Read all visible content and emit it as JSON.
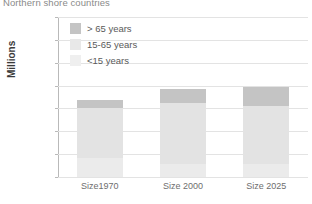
{
  "chart_data": {
    "type": "bar",
    "stacked": true,
    "title": "Northern shore countries",
    "xlabel": "",
    "ylabel": "Millions",
    "ylim": [
      0,
      350
    ],
    "yticks": [
      0,
      50,
      100,
      150,
      200,
      250,
      300,
      350
    ],
    "grid": true,
    "legend_position": "inside top-left",
    "categories": [
      "Size1970",
      "Size 2000",
      "Size 2025"
    ],
    "series": [
      {
        "name": "<15 years",
        "values": [
          42,
          29,
          28
        ],
        "color": "#ebebeb"
      },
      {
        "name": "15-65 years",
        "values": [
          110,
          133,
          127
        ],
        "color": "#e3e3e3"
      },
      {
        "name": "> 65 years",
        "values": [
          16,
          31,
          43
        ],
        "color": "#c4c4c4"
      }
    ],
    "totals": [
      168,
      193,
      198
    ],
    "legend_order": [
      "> 65 years",
      "15-65 years",
      "<15 years"
    ]
  },
  "axis": {
    "y_title": "Millions",
    "y_tick_labels": [
      "350",
      "300",
      "250",
      "200",
      "150",
      "100",
      "50",
      "0"
    ],
    "x_tick_labels": [
      "Size1970",
      "Size 2000",
      "Size 2025"
    ]
  },
  "legend": {
    "items": [
      {
        "label": "> 65 years",
        "color": "#c4c4c4"
      },
      {
        "label": "15-65 years",
        "color": "#e8e8e8"
      },
      {
        "label": "<15 years",
        "color": "#efefef"
      }
    ]
  },
  "colors": {
    "grid": "#e3e3e3",
    "axis": "#9a9a9a",
    "text": "#6e6e6e",
    "title": "#8a8a8a",
    "background": "#ffffff"
  }
}
